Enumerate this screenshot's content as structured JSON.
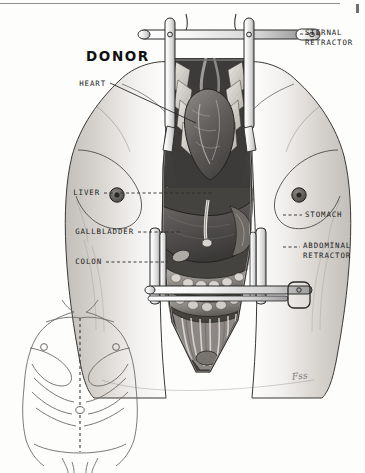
{
  "plate": {
    "title": "DONOR",
    "signature": "Fss",
    "background_color": "#fdfdfc",
    "ink_color": "#1a1a1a"
  },
  "labels": [
    {
      "id": "sternal-retractor",
      "text": "STERNAL\nRETRACTOR",
      "side": "right"
    },
    {
      "id": "heart",
      "text": "HEART",
      "side": "left"
    },
    {
      "id": "liver",
      "text": "LIVER",
      "side": "left"
    },
    {
      "id": "gallbladder",
      "text": "GALLBLADDER",
      "side": "left"
    },
    {
      "id": "colon",
      "text": "COLON",
      "side": "left"
    },
    {
      "id": "stomach",
      "text": "STOMACH",
      "side": "right"
    },
    {
      "id": "abdominal-retractor",
      "text": "ABDOMINAL\nRETRACTOR",
      "side": "right"
    }
  ],
  "figures": {
    "main": {
      "name": "opened-donor-torso"
    },
    "inset": {
      "name": "intact-torso-with-incision-line"
    }
  }
}
